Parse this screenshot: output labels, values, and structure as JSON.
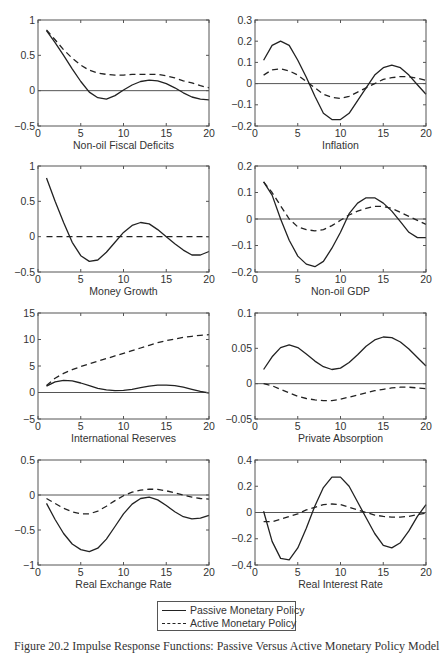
{
  "figure": {
    "caption": "Figure 20.2  Impulse Response Functions: Passive Versus Active Monetary Policy Model",
    "legend": {
      "entries": [
        {
          "label": "Passive Monetary Policy",
          "style": "solid"
        },
        {
          "label": "Active Monetary Policy",
          "style": "dashed"
        }
      ]
    },
    "colors": {
      "line": "#222222",
      "axis": "#555555",
      "zero_line": "#555555"
    }
  },
  "chart_data": [
    {
      "type": "line",
      "title": "",
      "xlabel": "Non-oil Fiscal Deficits",
      "ylabel": "",
      "xlim": [
        0,
        20
      ],
      "ylim": [
        -0.5,
        1
      ],
      "xticks": [
        0,
        5,
        10,
        15,
        20
      ],
      "xtick_labels": [
        "0",
        "5",
        "10",
        "15",
        "20"
      ],
      "yticks": [
        -0.5,
        0,
        0.5,
        1
      ],
      "ytick_labels": [
        "−0.5",
        "0",
        "0.5",
        "1"
      ],
      "grid": false,
      "zero_line": true,
      "x": [
        1,
        2,
        3,
        4,
        5,
        6,
        7,
        8,
        9,
        10,
        11,
        12,
        13,
        14,
        15,
        16,
        17,
        18,
        19,
        20
      ],
      "series": [
        {
          "name": "Passive Monetary Policy",
          "style": "solid",
          "values": [
            0.85,
            0.68,
            0.5,
            0.31,
            0.13,
            -0.02,
            -0.1,
            -0.12,
            -0.07,
            0.01,
            0.08,
            0.13,
            0.15,
            0.14,
            0.1,
            0.04,
            -0.03,
            -0.09,
            -0.12,
            -0.13
          ]
        },
        {
          "name": "Active Monetary Policy",
          "style": "dashed",
          "values": [
            0.86,
            0.72,
            0.58,
            0.46,
            0.36,
            0.29,
            0.25,
            0.23,
            0.22,
            0.22,
            0.23,
            0.23,
            0.23,
            0.23,
            0.21,
            0.18,
            0.14,
            0.11,
            0.07,
            0.04
          ]
        }
      ]
    },
    {
      "type": "line",
      "title": "",
      "xlabel": "Inflation",
      "ylabel": "",
      "xlim": [
        0,
        20
      ],
      "ylim": [
        -0.2,
        0.3
      ],
      "xticks": [
        0,
        5,
        10,
        15,
        20
      ],
      "xtick_labels": [
        "0",
        "5",
        "10",
        "15",
        "20"
      ],
      "yticks": [
        -0.2,
        -0.1,
        0,
        0.1,
        0.2,
        0.3
      ],
      "ytick_labels": [
        "−0.2",
        "−0.1",
        "0",
        "0.1",
        "0.2",
        "0.3"
      ],
      "grid": false,
      "zero_line": true,
      "x": [
        1,
        2,
        3,
        4,
        5,
        6,
        7,
        8,
        9,
        10,
        11,
        12,
        13,
        14,
        15,
        16,
        17,
        18,
        19,
        20
      ],
      "series": [
        {
          "name": "Passive Monetary Policy",
          "style": "solid",
          "values": [
            0.11,
            0.18,
            0.2,
            0.18,
            0.11,
            0.03,
            -0.06,
            -0.14,
            -0.17,
            -0.17,
            -0.14,
            -0.08,
            -0.02,
            0.04,
            0.075,
            0.087,
            0.075,
            0.04,
            -0.005,
            -0.05
          ]
        },
        {
          "name": "Active Monetary Policy",
          "style": "dashed",
          "values": [
            0.04,
            0.065,
            0.07,
            0.06,
            0.04,
            0.01,
            -0.02,
            -0.05,
            -0.065,
            -0.07,
            -0.06,
            -0.04,
            -0.02,
            0.0,
            0.02,
            0.028,
            0.033,
            0.032,
            0.025,
            0.015
          ]
        }
      ]
    },
    {
      "type": "line",
      "title": "",
      "xlabel": "Money Growth",
      "ylabel": "",
      "xlim": [
        0,
        20
      ],
      "ylim": [
        -0.5,
        1
      ],
      "xticks": [
        0,
        5,
        10,
        15,
        20
      ],
      "xtick_labels": [
        "0",
        "5",
        "10",
        "15",
        "20"
      ],
      "yticks": [
        -0.5,
        0,
        0.5,
        1
      ],
      "ytick_labels": [
        "−0.5",
        "0",
        "0.5",
        "1"
      ],
      "grid": false,
      "zero_line": false,
      "x": [
        1,
        2,
        3,
        4,
        5,
        6,
        7,
        8,
        9,
        10,
        11,
        12,
        13,
        14,
        15,
        16,
        17,
        18,
        19,
        20
      ],
      "series": [
        {
          "name": "Passive Monetary Policy",
          "style": "solid",
          "values": [
            0.83,
            0.5,
            0.2,
            -0.08,
            -0.27,
            -0.35,
            -0.33,
            -0.22,
            -0.08,
            0.06,
            0.16,
            0.2,
            0.18,
            0.1,
            0.0,
            -0.1,
            -0.19,
            -0.26,
            -0.26,
            -0.21
          ]
        },
        {
          "name": "Active Monetary Policy",
          "style": "dashed",
          "values": [
            0,
            0,
            0,
            0,
            0,
            0,
            0,
            0,
            0,
            0,
            0,
            0,
            0,
            0,
            0,
            0,
            0,
            0,
            0,
            0
          ]
        }
      ]
    },
    {
      "type": "line",
      "title": "",
      "xlabel": "Non-oil GDP",
      "ylabel": "",
      "xlim": [
        0,
        20
      ],
      "ylim": [
        -0.2,
        0.2
      ],
      "xticks": [
        0,
        5,
        10,
        15,
        20
      ],
      "xtick_labels": [
        "0",
        "5",
        "10",
        "15",
        "20"
      ],
      "yticks": [
        -0.2,
        -0.1,
        0,
        0.1,
        0.2
      ],
      "ytick_labels": [
        "−0.2",
        "−0.1",
        "0",
        "0.1",
        "0.2"
      ],
      "grid": false,
      "zero_line": true,
      "x": [
        1,
        2,
        3,
        4,
        5,
        6,
        7,
        8,
        9,
        10,
        11,
        12,
        13,
        14,
        15,
        16,
        17,
        18,
        19,
        20
      ],
      "series": [
        {
          "name": "Passive Monetary Policy",
          "style": "solid",
          "values": [
            0.14,
            0.09,
            0.0,
            -0.08,
            -0.14,
            -0.17,
            -0.18,
            -0.16,
            -0.11,
            -0.05,
            0.02,
            0.06,
            0.08,
            0.08,
            0.06,
            0.03,
            -0.01,
            -0.05,
            -0.07,
            -0.07
          ]
        },
        {
          "name": "Active Monetary Policy",
          "style": "dashed",
          "values": [
            0.14,
            0.1,
            0.05,
            0.0,
            -0.03,
            -0.04,
            -0.045,
            -0.04,
            -0.025,
            -0.005,
            0.015,
            0.03,
            0.04,
            0.048,
            0.047,
            0.04,
            0.025,
            0.01,
            -0.005,
            -0.02
          ]
        }
      ]
    },
    {
      "type": "line",
      "title": "",
      "xlabel": "International Reserves",
      "ylabel": "",
      "xlim": [
        0,
        20
      ],
      "ylim": [
        -5,
        15
      ],
      "xticks": [
        0,
        5,
        10,
        15,
        20
      ],
      "xtick_labels": [
        "0",
        "5",
        "10",
        "15",
        "20"
      ],
      "yticks": [
        -5,
        0,
        5,
        10,
        15
      ],
      "ytick_labels": [
        "−5",
        "0",
        "5",
        "10",
        "15"
      ],
      "grid": false,
      "zero_line": true,
      "x": [
        1,
        2,
        3,
        4,
        5,
        6,
        7,
        8,
        9,
        10,
        11,
        12,
        13,
        14,
        15,
        16,
        17,
        18,
        19,
        20
      ],
      "series": [
        {
          "name": "Passive Monetary Policy",
          "style": "solid",
          "values": [
            1.2,
            2.0,
            2.3,
            2.2,
            1.8,
            1.3,
            0.8,
            0.5,
            0.35,
            0.4,
            0.6,
            0.9,
            1.2,
            1.4,
            1.4,
            1.3,
            1.0,
            0.6,
            0.2,
            -0.1
          ]
        },
        {
          "name": "Active Monetary Policy",
          "style": "dashed",
          "values": [
            1.3,
            2.7,
            3.6,
            4.3,
            4.9,
            5.4,
            5.9,
            6.4,
            6.9,
            7.4,
            7.9,
            8.4,
            8.9,
            9.4,
            9.8,
            10.1,
            10.4,
            10.6,
            10.8,
            10.9
          ]
        }
      ]
    },
    {
      "type": "line",
      "title": "",
      "xlabel": "Private Absorption",
      "ylabel": "",
      "xlim": [
        0,
        20
      ],
      "ylim": [
        -0.05,
        0.1
      ],
      "xticks": [
        0,
        5,
        10,
        15,
        20
      ],
      "xtick_labels": [
        "0",
        "5",
        "10",
        "15",
        "20"
      ],
      "yticks": [
        -0.05,
        0,
        0.05,
        0.1
      ],
      "ytick_labels": [
        "−0.05",
        "0",
        "0.05",
        "0.1"
      ],
      "grid": false,
      "zero_line": true,
      "x": [
        1,
        2,
        3,
        4,
        5,
        6,
        7,
        8,
        9,
        10,
        11,
        12,
        13,
        14,
        15,
        16,
        17,
        18,
        19,
        20
      ],
      "series": [
        {
          "name": "Passive Monetary Policy",
          "style": "solid",
          "values": [
            0.02,
            0.038,
            0.051,
            0.055,
            0.051,
            0.042,
            0.032,
            0.024,
            0.02,
            0.022,
            0.03,
            0.041,
            0.053,
            0.062,
            0.066,
            0.065,
            0.059,
            0.049,
            0.037,
            0.025
          ]
        },
        {
          "name": "Active Monetary Policy",
          "style": "dashed",
          "values": [
            0.0,
            -0.003,
            -0.008,
            -0.013,
            -0.018,
            -0.021,
            -0.023,
            -0.024,
            -0.024,
            -0.022,
            -0.019,
            -0.016,
            -0.013,
            -0.01,
            -0.008,
            -0.006,
            -0.005,
            -0.005,
            -0.006,
            -0.007
          ]
        }
      ]
    },
    {
      "type": "line",
      "title": "",
      "xlabel": "Real Exchange Rate",
      "ylabel": "",
      "xlim": [
        0,
        20
      ],
      "ylim": [
        -1,
        0.5
      ],
      "xticks": [
        0,
        5,
        10,
        15,
        20
      ],
      "xtick_labels": [
        "0",
        "5",
        "10",
        "15",
        "20"
      ],
      "yticks": [
        -1,
        -0.5,
        0,
        0.5
      ],
      "ytick_labels": [
        "−1",
        "−0.5",
        "0",
        "0.5"
      ],
      "grid": false,
      "zero_line": true,
      "x": [
        1,
        2,
        3,
        4,
        5,
        6,
        7,
        8,
        9,
        10,
        11,
        12,
        13,
        14,
        15,
        16,
        17,
        18,
        19,
        20
      ],
      "series": [
        {
          "name": "Passive Monetary Policy",
          "style": "solid",
          "values": [
            -0.12,
            -0.35,
            -0.55,
            -0.7,
            -0.78,
            -0.81,
            -0.76,
            -0.63,
            -0.45,
            -0.27,
            -0.13,
            -0.05,
            -0.03,
            -0.07,
            -0.15,
            -0.24,
            -0.31,
            -0.34,
            -0.33,
            -0.29
          ]
        },
        {
          "name": "Active Monetary Policy",
          "style": "dashed",
          "values": [
            -0.05,
            -0.12,
            -0.19,
            -0.24,
            -0.27,
            -0.27,
            -0.23,
            -0.16,
            -0.08,
            -0.01,
            0.04,
            0.07,
            0.085,
            0.08,
            0.06,
            0.03,
            0.0,
            -0.03,
            -0.05,
            -0.06
          ]
        }
      ]
    },
    {
      "type": "line",
      "title": "",
      "xlabel": "Real Interest Rate",
      "ylabel": "",
      "xlim": [
        0,
        20
      ],
      "ylim": [
        -0.4,
        0.4
      ],
      "xticks": [
        0,
        5,
        10,
        15,
        20
      ],
      "xtick_labels": [
        "0",
        "5",
        "10",
        "15",
        "20"
      ],
      "yticks": [
        -0.4,
        -0.2,
        0,
        0.2,
        0.4
      ],
      "ytick_labels": [
        "−0.4",
        "−0.2",
        "0",
        "0.2",
        "0.4"
      ],
      "grid": false,
      "zero_line": true,
      "x": [
        1,
        2,
        3,
        4,
        5,
        6,
        7,
        8,
        9,
        10,
        11,
        12,
        13,
        14,
        15,
        16,
        17,
        18,
        19,
        20
      ],
      "series": [
        {
          "name": "Passive Monetary Policy",
          "style": "solid",
          "values": [
            0.01,
            -0.22,
            -0.35,
            -0.36,
            -0.27,
            -0.12,
            0.05,
            0.19,
            0.27,
            0.27,
            0.2,
            0.08,
            -0.04,
            -0.16,
            -0.25,
            -0.27,
            -0.23,
            -0.14,
            -0.03,
            0.06
          ]
        },
        {
          "name": "Active Monetary Policy",
          "style": "dashed",
          "values": [
            -0.07,
            -0.07,
            -0.05,
            -0.03,
            -0.01,
            0.02,
            0.04,
            0.06,
            0.065,
            0.06,
            0.04,
            0.02,
            0.0,
            -0.02,
            -0.03,
            -0.035,
            -0.035,
            -0.03,
            -0.015,
            -0.005
          ]
        }
      ]
    }
  ]
}
